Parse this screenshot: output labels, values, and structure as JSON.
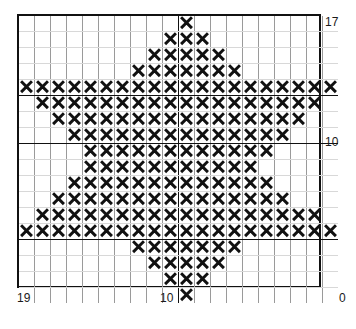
{
  "chart_data": {
    "type": "heatmap",
    "title": "",
    "subtitle": "",
    "xlabel": "",
    "ylabel": "",
    "grid": true,
    "legend": null,
    "columns": 20,
    "rows": 18,
    "cell_symbol": "X",
    "symbol_color": "#111111",
    "grid_color": "#9a9a9a",
    "grid_minor_color": "#d8d8d8",
    "grid_major_color": "#111111",
    "border_color": "#111111",
    "background": "#ffffff",
    "major_line_columns": [
      10
    ],
    "major_line_rows": [
      4,
      7,
      13
    ],
    "x_axis": {
      "direction": "right-to-left",
      "ticks": [
        {
          "label": "19",
          "position": "left"
        },
        {
          "label": "10",
          "position": "center"
        },
        {
          "label": "0",
          "position": "right"
        }
      ]
    },
    "y_axis": {
      "direction": "top-to-bottom",
      "ticks": [
        {
          "label": "17",
          "position": "top"
        },
        {
          "label": "10",
          "position": "middle"
        }
      ]
    },
    "filled_cells_by_row": [
      [
        10
      ],
      [
        9,
        10,
        11
      ],
      [
        8,
        9,
        10,
        11,
        12
      ],
      [
        7,
        8,
        9,
        10,
        11,
        12,
        13
      ],
      [
        0,
        1,
        2,
        3,
        4,
        5,
        6,
        7,
        8,
        9,
        10,
        11,
        12,
        13,
        14,
        15,
        16,
        17,
        18,
        19
      ],
      [
        1,
        2,
        3,
        4,
        5,
        6,
        7,
        8,
        9,
        10,
        11,
        12,
        13,
        14,
        15,
        16,
        17,
        18
      ],
      [
        2,
        3,
        4,
        5,
        6,
        7,
        8,
        9,
        10,
        11,
        12,
        13,
        14,
        15,
        16,
        17
      ],
      [
        3,
        4,
        5,
        6,
        7,
        8,
        9,
        10,
        11,
        12,
        13,
        14,
        15,
        16
      ],
      [
        4,
        5,
        6,
        7,
        8,
        9,
        10,
        11,
        12,
        13,
        14,
        15
      ],
      [
        4,
        5,
        6,
        7,
        8,
        9,
        10,
        11,
        12,
        13,
        14
      ],
      [
        3,
        4,
        5,
        6,
        7,
        8,
        9,
        10,
        11,
        12,
        13,
        14,
        15
      ],
      [
        2,
        3,
        4,
        5,
        6,
        7,
        8,
        9,
        10,
        11,
        12,
        13,
        14,
        15,
        16
      ],
      [
        1,
        2,
        3,
        4,
        5,
        6,
        7,
        8,
        9,
        10,
        11,
        12,
        13,
        14,
        15,
        16,
        17,
        18
      ],
      [
        0,
        1,
        2,
        3,
        4,
        5,
        6,
        7,
        8,
        9,
        10,
        11,
        12,
        13,
        14,
        15,
        16,
        17,
        18,
        19
      ],
      [
        7,
        8,
        9,
        10,
        11,
        12,
        13
      ],
      [
        8,
        9,
        10,
        11,
        12
      ],
      [
        9,
        10,
        11
      ],
      [
        10
      ]
    ],
    "row_fill_counts": [
      1,
      3,
      5,
      7,
      20,
      18,
      16,
      14,
      12,
      11,
      13,
      15,
      18,
      20,
      7,
      5,
      3,
      1
    ],
    "total_filled_cells": 189
  },
  "labels": {
    "right_top": "17",
    "right_middle": "10",
    "bottom_left": "19",
    "bottom_middle": "10",
    "bottom_right": "0"
  }
}
